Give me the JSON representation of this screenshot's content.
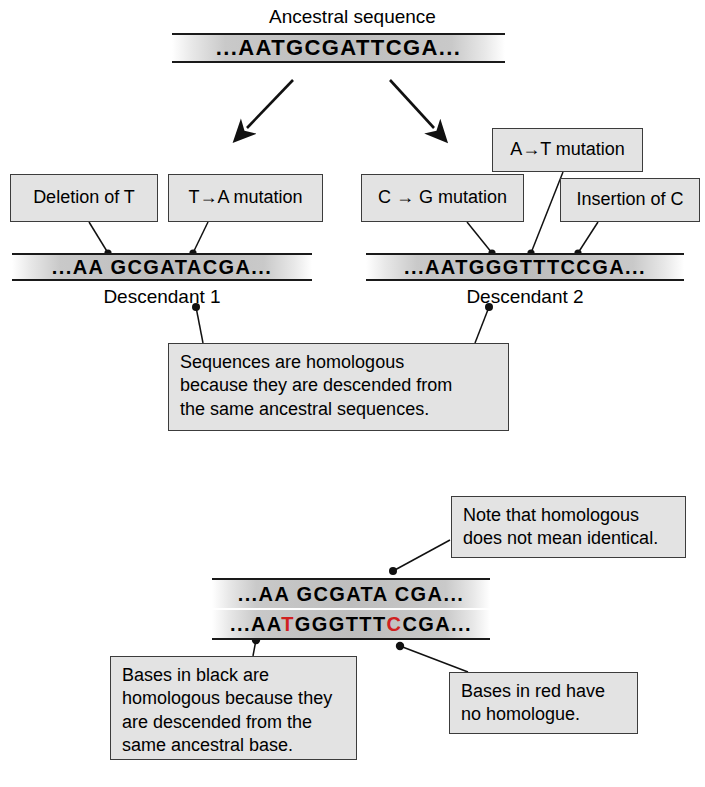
{
  "figure": {
    "title_label": "Ancestral sequence",
    "descendant1_label": "Descendant 1",
    "descendant2_label": "Descendant 2"
  },
  "sequences": {
    "ancestral": "...AATGCGATTCGA...",
    "descendant1": "...AA GCGATACGA...",
    "descendant2": "...AATGGGTTTCCGA...",
    "aligned_top": "...AA GCGATA CGA...",
    "aligned_bottom_parts": [
      {
        "text": "...AA",
        "color": "black"
      },
      {
        "text": "T",
        "color": "red"
      },
      {
        "text": "GGGTTT",
        "color": "black"
      },
      {
        "text": "C",
        "color": "red"
      },
      {
        "text": "CGA...",
        "color": "black"
      }
    ]
  },
  "callouts": {
    "deletion_of_t": "Deletion of T",
    "t_to_a_mutation": "T→A mutation",
    "c_to_g_mutation": "C → G mutation",
    "a_to_t_mutation": "A→T mutation",
    "insertion_of_c": "Insertion of C",
    "homologous_note": "Sequences are homologous\nbecause they are descended from\nthe same ancestral sequences.",
    "not_identical_note": "Note that homologous\ndoes not mean identical.",
    "black_bases_note": "Bases in black are\nhomologous because they\nare descended from the\nsame ancestral base.",
    "red_bases_note": "Bases in red have\nno homologue."
  },
  "colors": {
    "box_fill": "#e3e3e3",
    "box_border": "#3c3c3c",
    "ink": "#000000",
    "red_base": "#d02020"
  }
}
